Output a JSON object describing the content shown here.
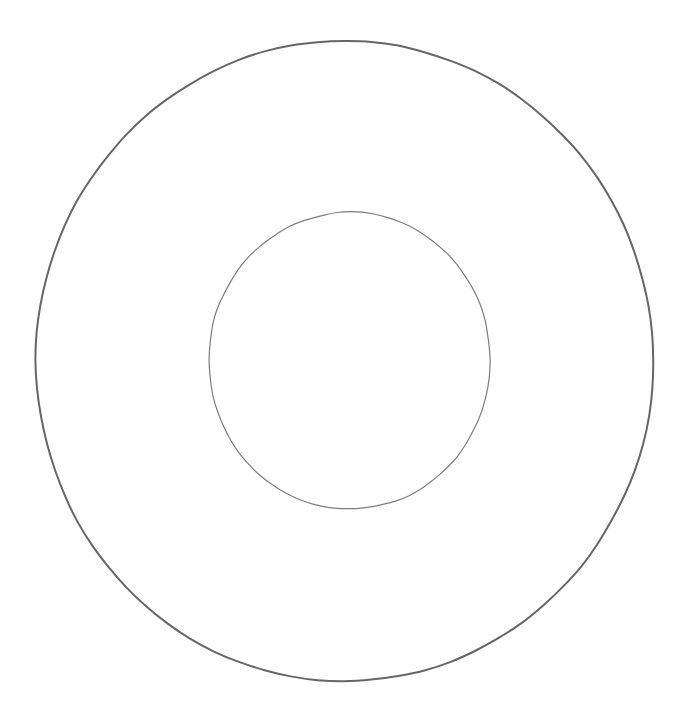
{
  "canvas": {
    "width": 687,
    "height": 719,
    "background_color": "#ffffff",
    "title": "Concentric Circles Diagram",
    "description": "Two unfilled concentric circles drawn as thin gray outlines on a plain white background, forming an annulus or ring shape."
  },
  "shapes": [
    {
      "id": "outer-circle",
      "name": "outer-circle",
      "type": "circle",
      "label": "Outer circle",
      "center_x": 344.5,
      "center_y": 361,
      "radius_x": 308.5,
      "radius_y": 320,
      "bounds": {
        "left": 36,
        "top": 41,
        "right": 653,
        "bottom": 681
      },
      "stroke_color": "#666666",
      "stroke_width": 2.0,
      "fill": "none"
    },
    {
      "id": "inner-circle",
      "name": "inner-circle",
      "type": "circle",
      "label": "Inner circle",
      "center_x": 349.5,
      "center_y": 360.5,
      "radius_x": 140.5,
      "radius_y": 148.5,
      "bounds": {
        "left": 209,
        "top": 212,
        "right": 490,
        "bottom": 509
      },
      "stroke_color": "#7d7d7d",
      "stroke_width": 1.2,
      "fill": "none"
    }
  ],
  "chart_data": {
    "type": "diagram",
    "title": "",
    "subtitle": "",
    "xlabel": "",
    "ylabel": "",
    "grid": false,
    "legend": null,
    "annotations": [],
    "series": [
      {
        "name": "Outer circle",
        "geometry": "circle",
        "cx": 344.5,
        "cy": 361,
        "rx": 308.5,
        "ry": 320,
        "color": "#666666",
        "line_width": 2.0,
        "filled": false
      },
      {
        "name": "Inner circle",
        "geometry": "circle",
        "cx": 349.5,
        "cy": 360.5,
        "rx": 140.5,
        "ry": 148.5,
        "color": "#7d7d7d",
        "line_width": 1.2,
        "filled": false
      }
    ]
  }
}
